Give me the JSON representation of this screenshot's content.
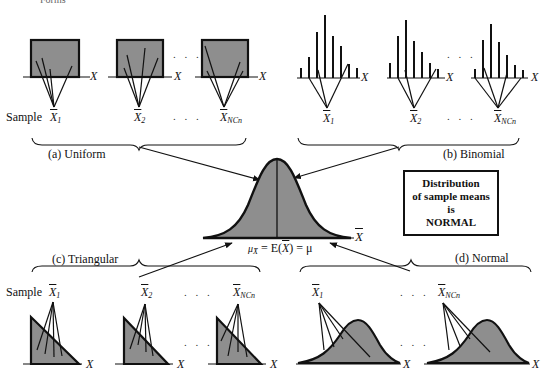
{
  "header": {
    "partial_title": "Forms"
  },
  "groups": {
    "uniform": {
      "label": "(a) Uniform"
    },
    "binomial": {
      "label": "(b) Binomial"
    },
    "triangular": {
      "label": "(c) Triangular"
    },
    "normal": {
      "label": "(d) Normal"
    }
  },
  "axis_label": "X",
  "sample_prefix": "Sample",
  "sample_symbols": [
    "X",
    "X",
    "X"
  ],
  "sample_subscripts": [
    "1",
    "2",
    "NCn"
  ],
  "ellipsis": ". . .",
  "center": {
    "axis_label": "X",
    "mean_equation_left": "μ",
    "mean_equation_sub": "X̄",
    "mean_equation_mid": " = E(",
    "mean_equation_x": "X",
    "mean_equation_right": ") = μ"
  },
  "callout": {
    "line1": "Distribution",
    "line2": "of sample means",
    "line3": "is",
    "line4": "NORMAL"
  },
  "colors": {
    "fill": "#8e8e8e",
    "stroke": "#111111",
    "background": "#ffffff"
  }
}
